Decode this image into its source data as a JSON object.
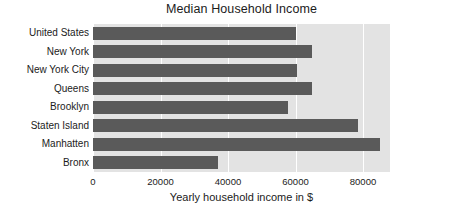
{
  "chart_data": {
    "type": "bar",
    "orientation": "horizontal",
    "title": "Median Household Income",
    "xlabel": "Yearly household income in $",
    "ylabel": "",
    "categories": [
      "United States",
      "New York",
      "New York City",
      "Queens",
      "Brooklyn",
      "Staten Island",
      "Manhatten",
      "Bronx"
    ],
    "values": [
      60000,
      64800,
      60300,
      64800,
      57800,
      78500,
      85000,
      37000
    ],
    "xlim": [
      0,
      88000
    ],
    "xticks": [
      0,
      20000,
      40000,
      60000,
      80000
    ],
    "xticklabels": [
      "0",
      "20000",
      "40000",
      "60000",
      "80000"
    ],
    "grid": true,
    "grid_axis": "x",
    "legend": false,
    "bar_color": "#5a5a5a",
    "plot_background": "#e3e3e3",
    "figure_background": "#ffffff"
  }
}
